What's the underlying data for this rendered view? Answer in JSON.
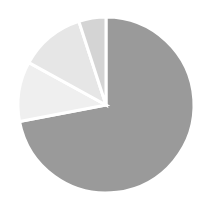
{
  "chart_data": {
    "type": "pie",
    "title": "",
    "categories": [
      "Slice A",
      "Slice B",
      "Slice C",
      "Slice D"
    ],
    "values": [
      72,
      11,
      12,
      5
    ],
    "colors": [
      "#9a9a9a",
      "#efefef",
      "#e6e6e6",
      "#d4d4d4"
    ],
    "start_angle_deg": 0,
    "direction": "clockwise",
    "legend": "none",
    "labels_shown": false,
    "separator_color": "#ffffff"
  },
  "layout": {
    "cx": 106,
    "cy": 105,
    "r": 88
  }
}
